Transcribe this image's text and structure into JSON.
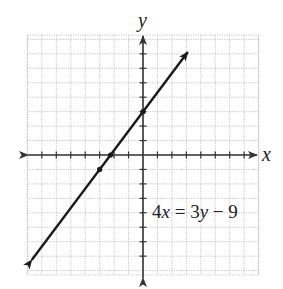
{
  "chart_data": {
    "type": "line",
    "title": "",
    "equation_label": "4x = 3y − 9",
    "equation_parts": [
      "4",
      "x",
      " = 3",
      "y",
      " − 9"
    ],
    "xlabel": "x",
    "ylabel": "y",
    "xlim": [
      -8,
      8
    ],
    "ylim": [
      -8.3,
      8.3
    ],
    "grid": true,
    "grid_style": "dotted",
    "tick_spacing": 1,
    "tick_labels": false,
    "legend": null,
    "series": [
      {
        "name": "4x = 3y - 9",
        "slope": 1.3333,
        "intercept": 3,
        "x": [
          -7.7,
          -3,
          -2.25,
          0,
          3.1
        ],
        "y": [
          -7.267,
          -1,
          0,
          3,
          7.133
        ],
        "marked_points": [
          [
            -3,
            -1
          ],
          [
            -2.25,
            0
          ],
          [
            0,
            3
          ]
        ],
        "arrows_both_ends": true
      }
    ]
  },
  "colors": {
    "line": "#1a1a1a",
    "axis": "#333333",
    "grid": "#b5b5b5",
    "background": "#ffffff"
  }
}
